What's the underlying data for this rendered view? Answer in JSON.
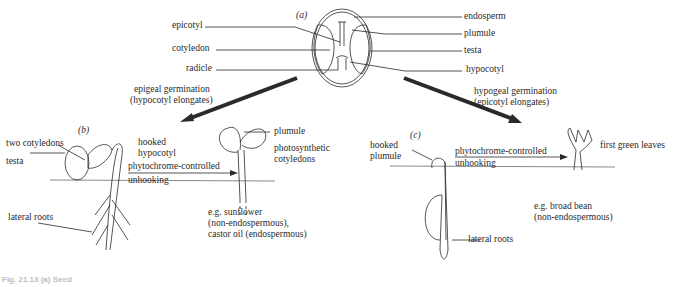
{
  "diagram": {
    "panels": {
      "a": {
        "label": "(a)",
        "left_labels": [
          "epicotyl",
          "cotyledon",
          "radicle"
        ],
        "right_labels": [
          "endosperm",
          "plumule",
          "testa",
          "hypocotyl"
        ]
      },
      "arrows": {
        "left_line1": "epigeal germination",
        "left_line2": "(hypocotyl elongates)",
        "right_line1": "hypogeal germination",
        "right_line2": "(epicotyl elongates)"
      },
      "b": {
        "label": "(b)",
        "two_cotyledons": "two cotyledons",
        "testa": "testa",
        "hooked_line1": "hooked",
        "hooked_line2": "hypocotyl",
        "phyto_line1": "phytochrome-controlled",
        "phyto_line2": "unhooking",
        "lateral_roots": "lateral roots",
        "plumule": "plumule",
        "photo_line1": "photosynthetic",
        "photo_line2": "cotyledons",
        "example_line1": "e.g. sunflower",
        "example_line2": "(non-endospermous),",
        "example_line3": "castor oil (endospermous)"
      },
      "c": {
        "label": "(c)",
        "hooked_line1": "hooked",
        "hooked_line2": "plumule",
        "phyto_line1": "phytochrome-controlled",
        "phyto_line2": "unhooking",
        "first_leaves": "first green leaves",
        "lateral_roots": "lateral roots",
        "example_line1": "e.g. broad bean",
        "example_line2": "(non-endospermous)"
      }
    },
    "caption": "Fig. 21.13 (a) Seed"
  }
}
